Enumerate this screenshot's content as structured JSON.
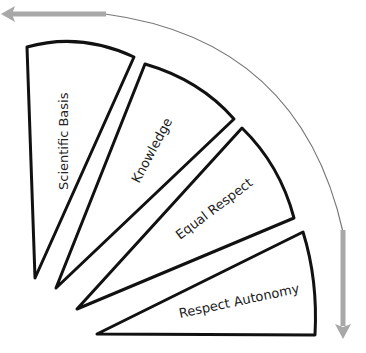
{
  "diagram": {
    "type": "fan-of-wedges",
    "wedges": [
      {
        "label": "Scientific Basis"
      },
      {
        "label": "Knowledge"
      },
      {
        "label": "Equal Respect"
      },
      {
        "label": "Respect Autonomy"
      }
    ],
    "arrow": {
      "direction": "both-ends",
      "start": "top-left (pointing left)",
      "end": "bottom-right (pointing down)",
      "color": "#a8a8a8",
      "line_color": "#777777"
    }
  }
}
